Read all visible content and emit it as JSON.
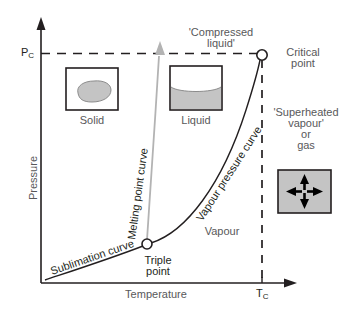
{
  "figure": {
    "type": "phase-diagram",
    "kind": "pressure-temperature phase diagram of a pure substance",
    "background_color": "#ffffff",
    "line_color": "#231f20",
    "text_color": "#58585a",
    "fill_gray": "#c8c8c8"
  },
  "axes": {
    "x_label": "Temperature",
    "y_label": "Pressure",
    "x_tick_label": "T",
    "x_tick_sub": "C",
    "y_tick_label": "P",
    "y_tick_sub": "C"
  },
  "regions": {
    "solid_label": "Solid",
    "liquid_label": "Liquid",
    "vapour_label": "Vapour",
    "compressed_liquid_label_line1": "'Compressed",
    "compressed_liquid_label_line2": "liquid'",
    "superheated_line1": "'Superheated",
    "superheated_line2": "vapour'",
    "superheated_line3": "or",
    "superheated_line4": "gas"
  },
  "curves": {
    "melting": "Melting point curve",
    "vapour_pressure": "Vapour pressure curve",
    "sublimation": "Sublimation curve"
  },
  "points": {
    "critical_line1": "Critical",
    "critical_line2": "point",
    "triple_line1": "Triple",
    "triple_line2": "point"
  }
}
